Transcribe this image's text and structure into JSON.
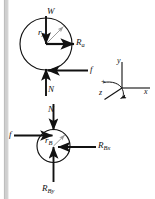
{
  "diagram": {
    "type": "free-body-diagram",
    "background_color": "#ffffff",
    "stroke_color": "#111111",
    "wall_color": "#c9c9c9",
    "radius_line_color": "#9a9a9a",
    "bodies": [
      {
        "name": "upper-body",
        "shape": "circle",
        "center": [
          46,
          44
        ],
        "radius": 26,
        "radius_label": "r",
        "radius_subscript": "A"
      },
      {
        "name": "lower-body",
        "shape": "circle",
        "center": [
          53.5,
          146
        ],
        "radius": 16.5,
        "radius_label": "r",
        "radius_subscript": "B"
      }
    ],
    "force_labels": {
      "weight": "W",
      "reaction_a": "R",
      "reaction_a_sub": "a",
      "friction_upper": "f",
      "normal_upper": "N",
      "normal_lower": "N",
      "friction_lower": "f",
      "reaction_bx": "R",
      "reaction_bx_sub": "Bx",
      "reaction_by": "R",
      "reaction_by_sub": "By"
    },
    "axes": {
      "name": "coordinate-triad",
      "origin": [
        122,
        88
      ],
      "x_label": "x",
      "y_label": "y",
      "z_label": "z",
      "sign_label": "+",
      "rotation_sense": "counterclockwise about z"
    }
  }
}
